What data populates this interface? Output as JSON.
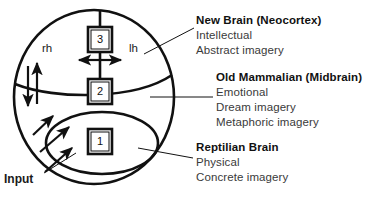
{
  "figure": {
    "name": "triune-brain-model",
    "background_color": "#ffffff",
    "stroke_color": "#111111"
  },
  "diagram": {
    "inline_labels": {
      "right_hemisphere": "rh",
      "left_hemisphere": "lh",
      "input": "Input"
    },
    "boxes": [
      {
        "id": "box-3",
        "label": "3"
      },
      {
        "id": "box-2",
        "label": "2"
      },
      {
        "id": "box-1",
        "label": "1"
      }
    ]
  },
  "legend": {
    "new_brain": {
      "title": "New Brain  (Neocortex)",
      "items": [
        "Intellectual",
        "Abstract imagery"
      ]
    },
    "old_mammalian": {
      "title": "Old Mammalian  (Midbrain)",
      "items": [
        "Emotional",
        "Dream imagery",
        "Metaphoric imagery"
      ]
    },
    "reptilian": {
      "title": "Reptilian Brain",
      "items": [
        "Physical",
        "Concrete imagery"
      ]
    }
  }
}
